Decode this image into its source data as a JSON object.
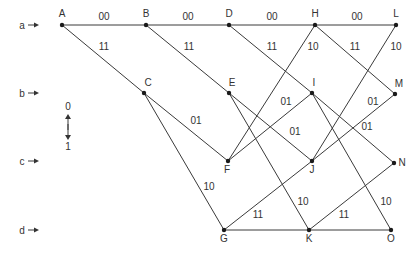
{
  "diagram": {
    "title": "",
    "states": [
      {
        "label": "a",
        "y": 25
      },
      {
        "label": "b",
        "y": 93
      },
      {
        "label": "c",
        "y": 161
      },
      {
        "label": "d",
        "y": 230
      }
    ],
    "legend": {
      "top": "0",
      "bottom": "1"
    },
    "nodes": [
      {
        "id": "A",
        "x": 62,
        "y": 25,
        "lx": 62,
        "ly": 17
      },
      {
        "id": "B",
        "x": 146,
        "y": 25,
        "lx": 146,
        "ly": 17
      },
      {
        "id": "D",
        "x": 229,
        "y": 25,
        "lx": 229,
        "ly": 17
      },
      {
        "id": "H",
        "x": 315,
        "y": 25,
        "lx": 315,
        "ly": 17
      },
      {
        "id": "L",
        "x": 396,
        "y": 25,
        "lx": 396,
        "ly": 17
      },
      {
        "id": "C",
        "x": 144,
        "y": 93,
        "lx": 148,
        "ly": 86
      },
      {
        "id": "E",
        "x": 229,
        "y": 93,
        "lx": 232,
        "ly": 86
      },
      {
        "id": "I",
        "x": 312,
        "y": 93,
        "lx": 314,
        "ly": 86
      },
      {
        "id": "M",
        "x": 395,
        "y": 94,
        "lx": 399,
        "ly": 87
      },
      {
        "id": "F",
        "x": 228,
        "y": 161,
        "lx": 227,
        "ly": 173
      },
      {
        "id": "J",
        "x": 312,
        "y": 161,
        "lx": 312,
        "ly": 173
      },
      {
        "id": "N",
        "x": 394,
        "y": 163,
        "lx": 402,
        "ly": 166
      },
      {
        "id": "G",
        "x": 224,
        "y": 230,
        "lx": 224,
        "ly": 242
      },
      {
        "id": "K",
        "x": 309,
        "y": 230,
        "lx": 309,
        "ly": 242
      },
      {
        "id": "O",
        "x": 391,
        "y": 230,
        "lx": 391,
        "ly": 242
      }
    ],
    "edges": [
      {
        "from": "A",
        "to": "B",
        "label": "00",
        "lx": 104,
        "ly": 20
      },
      {
        "from": "B",
        "to": "D",
        "label": "00",
        "lx": 188,
        "ly": 20
      },
      {
        "from": "D",
        "to": "H",
        "label": "00",
        "lx": 272,
        "ly": 20
      },
      {
        "from": "H",
        "to": "L",
        "label": "00",
        "lx": 357,
        "ly": 20
      },
      {
        "from": "A",
        "to": "C",
        "label": "11",
        "lx": 104,
        "ly": 50
      },
      {
        "from": "B",
        "to": "E",
        "label": "11",
        "lx": 189,
        "ly": 50
      },
      {
        "from": "D",
        "to": "I",
        "label": "11",
        "lx": 272,
        "ly": 50
      },
      {
        "from": "H",
        "to": "M",
        "label": "11",
        "lx": 355,
        "ly": 50
      },
      {
        "from": "F",
        "to": "H",
        "label": "10",
        "lx": 313,
        "ly": 50
      },
      {
        "from": "J",
        "to": "L",
        "label": "10",
        "lx": 396,
        "ly": 50
      },
      {
        "from": "C",
        "to": "F",
        "label": "01",
        "lx": 196,
        "ly": 124
      },
      {
        "from": "F",
        "to": "I",
        "label": "01",
        "lx": 286,
        "ly": 105
      },
      {
        "from": "E",
        "to": "J",
        "label": "01",
        "lx": 295,
        "ly": 135
      },
      {
        "from": "J",
        "to": "M",
        "label": "01",
        "lx": 373,
        "ly": 105
      },
      {
        "from": "I",
        "to": "N",
        "label": "01",
        "lx": 367,
        "ly": 130
      },
      {
        "from": "C",
        "to": "G",
        "label": "10",
        "lx": 209,
        "ly": 190
      },
      {
        "from": "E",
        "to": "K",
        "label": "10",
        "lx": 303,
        "ly": 205
      },
      {
        "from": "I",
        "to": "O",
        "label": "10",
        "lx": 386,
        "ly": 205
      },
      {
        "from": "G",
        "to": "J",
        "label": "11",
        "lx": 258,
        "ly": 218
      },
      {
        "from": "K",
        "to": "N",
        "label": "11",
        "lx": 344,
        "ly": 218
      },
      {
        "from": "G",
        "to": "K",
        "label": "",
        "lx": 0,
        "ly": 0
      },
      {
        "from": "K",
        "to": "O",
        "label": "",
        "lx": 0,
        "ly": 0
      }
    ]
  }
}
